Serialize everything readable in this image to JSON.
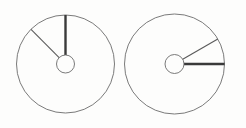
{
  "figure": {
    "background_color": "#fdfdfc",
    "width": 246,
    "height": 128
  },
  "style": {
    "outline_color": "#6b6b6b",
    "outline_width": 0.9,
    "hub_color": "#6b6b6b",
    "hub_width": 0.9,
    "thin_needle_color": "#5a5a5a",
    "thin_needle_width": 1.1,
    "thick_needle_color": "#3a3a3a",
    "thick_needle_width": 2.4
  },
  "dials": [
    {
      "id": "left-dial",
      "label": "Left dial",
      "center": {
        "x": 65.5,
        "y": 64.0
      },
      "outer_radius": 49.0,
      "hub_radius": 9.0,
      "needles": [
        {
          "id": "left-dial-thick-needle",
          "label": "Thick needle pointing up (12 o'clock)",
          "angle_deg": 90,
          "clock_position": "12:00",
          "weight": "thick",
          "tip": {
            "x": 65.5,
            "y": 15.0
          }
        },
        {
          "id": "left-dial-thin-needle",
          "label": "Thin needle pointing upper-left (10 o'clock)",
          "angle_deg": 135,
          "clock_position": "10:00",
          "weight": "thin",
          "tip": {
            "x": 31.0,
            "y": 29.4
          }
        }
      ]
    },
    {
      "id": "right-dial",
      "label": "Right dial",
      "center": {
        "x": 174.5,
        "y": 64.0
      },
      "outer_radius": 50.0,
      "hub_radius": 9.5,
      "needles": [
        {
          "id": "right-dial-thick-needle",
          "label": "Thick needle pointing right (3 o'clock)",
          "angle_deg": 0,
          "clock_position": "03:00",
          "weight": "thick",
          "tip": {
            "x": 224.5,
            "y": 64.0
          }
        },
        {
          "id": "right-dial-thin-needle",
          "label": "Thin needle pointing upper-right (1:30)",
          "angle_deg": 30,
          "clock_position": "01:30",
          "weight": "thin",
          "tip": {
            "x": 217.8,
            "y": 39.0
          }
        }
      ]
    }
  ]
}
